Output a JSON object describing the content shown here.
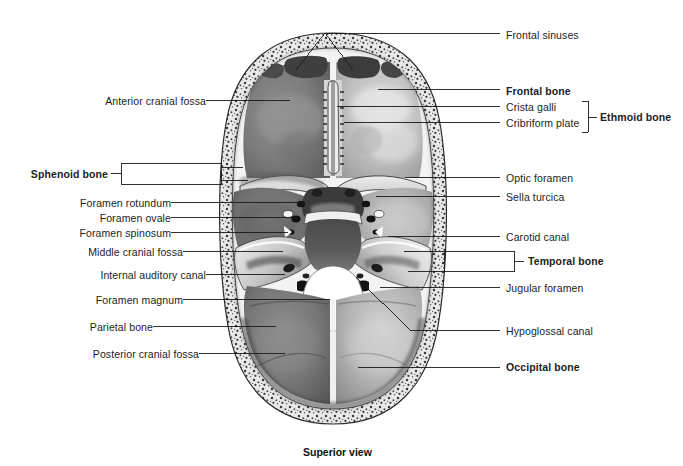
{
  "figure": {
    "title_caption": "Superior view",
    "view": "Superior view of the floor of the cranial cavity (skull base)",
    "background_color": "#ffffff",
    "line_color": "#1a1a1a"
  },
  "labels_left": [
    {
      "id": "anterior-cranial-fossa",
      "text": "Anterior cranial fossa",
      "bold": false,
      "text_x": 200,
      "text_y": 103,
      "line_from_x": 206,
      "line_to_x": 290,
      "line_y": 100
    },
    {
      "id": "sphenoid-bone",
      "text": "Sphenoid bone",
      "bold": true,
      "text_x": 104,
      "text_y": 176,
      "bracket": true
    },
    {
      "id": "foramen-rotundum",
      "text": "Foramen rotundum",
      "bold": false,
      "text_x": 165,
      "text_y": 205,
      "line_from_x": 171,
      "line_to_x": 300,
      "line_y": 202
    },
    {
      "id": "foramen-ovale",
      "text": "Foramen ovale",
      "bold": false,
      "text_x": 165,
      "text_y": 220,
      "line_from_x": 171,
      "line_to_x": 295,
      "line_y": 217
    },
    {
      "id": "foramen-spinosum",
      "text": "Foramen spinosum",
      "bold": false,
      "text_x": 165,
      "text_y": 235,
      "line_from_x": 171,
      "line_to_x": 288,
      "line_y": 232
    },
    {
      "id": "middle-cranial-fossa",
      "text": "Middle cranial fossa",
      "bold": false,
      "text_x": 177,
      "text_y": 254,
      "line_from_x": 183,
      "line_to_x": 285,
      "line_y": 251
    },
    {
      "id": "internal-auditory-canal",
      "text": "Internal auditory canal",
      "bold": false,
      "text_x": 200,
      "text_y": 277,
      "line_from_x": 206,
      "line_to_x": 290,
      "line_y": 274
    },
    {
      "id": "foramen-magnum",
      "text": "Foramen magnum",
      "bold": false,
      "text_x": 177,
      "text_y": 302,
      "line_from_x": 183,
      "line_to_x": 330,
      "line_y": 299
    },
    {
      "id": "parietal-bone",
      "text": "Parietal bone",
      "bold": false,
      "text_x": 147,
      "text_y": 329,
      "line_from_x": 153,
      "line_to_x": 276,
      "line_y": 326
    },
    {
      "id": "posterior-cranial-fossa",
      "text": "Posterior cranial fossa",
      "bold": false,
      "text_x": 193,
      "text_y": 356,
      "line_from_x": 199,
      "line_to_x": 285,
      "line_y": 353
    }
  ],
  "labels_right": [
    {
      "id": "frontal-sinuses",
      "text": "Frontal sinuses",
      "bold": false,
      "text_x": 504,
      "text_y": 36,
      "line_from_x": 500,
      "line_to_x": 325,
      "line_y": 33
    },
    {
      "id": "frontal-bone",
      "text": "Frontal bone",
      "bold": true,
      "text_x": 504,
      "text_y": 92,
      "line_from_x": 500,
      "line_to_x": 378,
      "line_y": 89
    },
    {
      "id": "crista-galli",
      "text": "Crista galli",
      "bold": false,
      "text_x": 504,
      "text_y": 109,
      "line_from_x": 500,
      "line_to_x": 345,
      "line_y": 106
    },
    {
      "id": "cribriform-plate",
      "text": "Cribriform plate",
      "bold": false,
      "text_x": 504,
      "text_y": 125,
      "line_from_x": 500,
      "line_to_x": 352,
      "line_y": 122
    },
    {
      "id": "ethmoid-bone",
      "text": "Ethmoid bone",
      "bold": true,
      "text_x": 600,
      "text_y": 117,
      "bracket": true
    },
    {
      "id": "optic-foramen",
      "text": "Optic foramen",
      "bold": false,
      "text_x": 504,
      "text_y": 180,
      "line_from_x": 500,
      "line_to_x": 405,
      "line_y": 177
    },
    {
      "id": "sella-turcica",
      "text": "Sella turcica",
      "bold": false,
      "text_x": 504,
      "text_y": 199,
      "line_from_x": 500,
      "line_to_x": 380,
      "line_y": 196
    },
    {
      "id": "carotid-canal",
      "text": "Carotid canal",
      "bold": false,
      "text_x": 504,
      "text_y": 239,
      "line_from_x": 500,
      "line_to_x": 396,
      "line_y": 236
    },
    {
      "id": "temporal-bone",
      "text": "Temporal bone",
      "bold": true,
      "text_x": 528,
      "text_y": 263,
      "bracket": true
    },
    {
      "id": "jugular-foramen",
      "text": "Jugular foramen",
      "bold": false,
      "text_x": 504,
      "text_y": 290,
      "line_from_x": 500,
      "line_to_x": 398,
      "line_y": 287
    },
    {
      "id": "hypoglossal-canal",
      "text": "Hypoglossal canal",
      "bold": false,
      "text_x": 504,
      "text_y": 333,
      "line_from_x": 500,
      "line_to_x": 400,
      "line_y": 330
    },
    {
      "id": "occipital-bone",
      "text": "Occipital bone",
      "bold": true,
      "text_x": 504,
      "text_y": 370,
      "line_from_x": 500,
      "line_to_x": 358,
      "line_y": 367
    }
  ],
  "caption": {
    "text": "Superior view",
    "x": 341,
    "y": 453
  },
  "anatomy_regions": [
    "frontal sinuses",
    "anterior cranial fossa",
    "crista galli",
    "cribriform plate",
    "optic foramen",
    "sella turcica",
    "foramen rotundum",
    "foramen ovale",
    "foramen spinosum",
    "middle cranial fossa",
    "internal auditory canal",
    "carotid canal",
    "jugular foramen",
    "hypoglossal canal",
    "foramen magnum",
    "posterior cranial fossa",
    "frontal bone",
    "parietal bone",
    "temporal bone",
    "sphenoid bone",
    "ethmoid bone",
    "occipital bone"
  ]
}
